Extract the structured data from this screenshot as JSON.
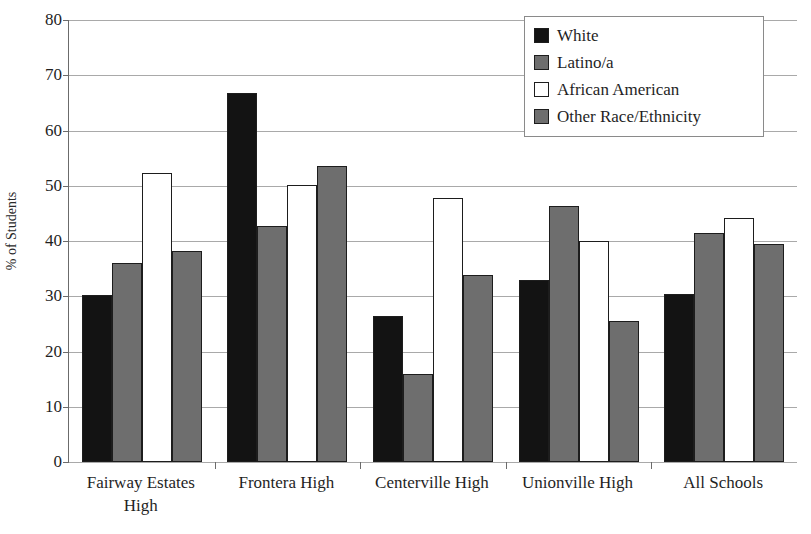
{
  "chart_data": {
    "type": "bar",
    "title": "",
    "xlabel": "",
    "ylabel": "% of Students",
    "ylim": [
      0,
      80
    ],
    "yticks": [
      0,
      10,
      20,
      30,
      40,
      50,
      60,
      70,
      80
    ],
    "grid": true,
    "legend_position": "top-right",
    "categories": [
      "Fairway Estates High",
      "Frontera High",
      "Centerville High",
      "Unionville High",
      "All Schools"
    ],
    "series": [
      {
        "name": "White",
        "color": "#131313",
        "values": [
          30.2,
          66.8,
          26.4,
          32.9,
          30.4
        ]
      },
      {
        "name": "Latino/a",
        "color": "#6e6e6e",
        "values": [
          36.0,
          42.8,
          15.9,
          46.4,
          41.4
        ]
      },
      {
        "name": "African American",
        "color": "#ffffff",
        "values": [
          52.3,
          50.2,
          47.7,
          40.0,
          44.1
        ]
      },
      {
        "name": "Other Race/Ethnicity",
        "color": "#6e6e6e",
        "values": [
          38.2,
          53.6,
          33.8,
          25.6,
          39.5
        ]
      }
    ]
  },
  "axis": {
    "y_title": "% of Students",
    "tick_labels": [
      "0",
      "10",
      "20",
      "30",
      "40",
      "50",
      "60",
      "70",
      "80"
    ],
    "category_labels": [
      "Fairway Estates High",
      "Frontera High",
      "Centerville High",
      "Unionville High",
      "All Schools"
    ]
  },
  "legend": {
    "entries": [
      {
        "label": "White"
      },
      {
        "label": "Latino/a"
      },
      {
        "label": "African American"
      },
      {
        "label": "Other Race/Ethnicity"
      }
    ]
  }
}
